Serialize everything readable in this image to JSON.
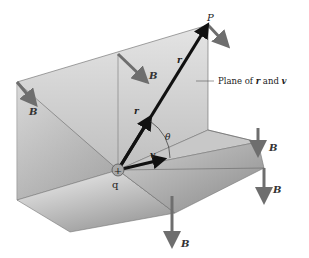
{
  "figure": {
    "type": "physics-diagram",
    "labels": {
      "point": "P",
      "charge": "q",
      "charge_sign": "+",
      "position_vector": "r",
      "position_vector_near": "r",
      "velocity": "v",
      "angle": "θ",
      "field": "B",
      "plane_caption": "Plane of r and v",
      "plane_caption_prefix": "Plane of ",
      "plane_caption_r": "r",
      "plane_caption_and": " and ",
      "plane_caption_v": "v"
    },
    "field_arrows": [
      {
        "id": "b-left",
        "label": "B"
      },
      {
        "id": "b-mid",
        "label": "B"
      },
      {
        "id": "b-right-top",
        "label": "B"
      },
      {
        "id": "b-right",
        "label": "B"
      },
      {
        "id": "b-bottom",
        "label": "B"
      }
    ],
    "colors": {
      "plane_light": "#e6e6e6",
      "plane_dark": "#9a9a9a",
      "arrow_gray": "#6e6e6e",
      "vector_black": "#111111",
      "edge": "#555555"
    }
  }
}
